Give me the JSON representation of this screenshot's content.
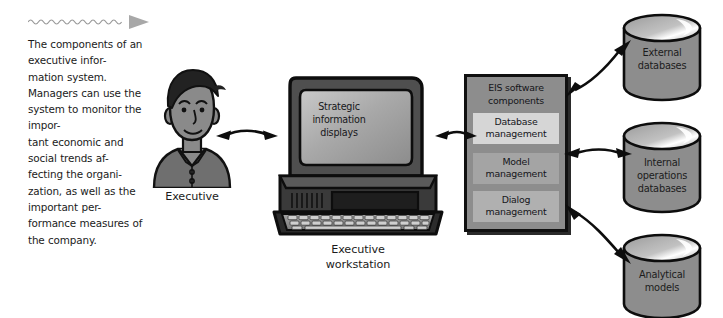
{
  "figure": {
    "caption": "The components of an executive infor-\nmation system. Managers can use the system to monitor the impor-\ntant economic and social trends af-\nfecting the organi-\nzation, as well as the important per-\nformance measures of the company.",
    "rule_icon": "wavy-line-arrow-icon"
  },
  "nodes": {
    "executive": {
      "label": "Executive",
      "icon": "executive-person-icon"
    },
    "workstation": {
      "label": "Executive\nworkstation",
      "screen_text": "Strategic\ninformation\ndisplays",
      "icon": "desktop-computer-icon"
    },
    "eis": {
      "title": "EIS software\ncomponents",
      "items": [
        {
          "label": "Database\nmanagement",
          "fill": "#d6d6d6"
        },
        {
          "label": "Model\nmanagement",
          "fill": "#a4a4a4"
        },
        {
          "label": "Dialog\nmanagement",
          "fill": "#b0b0b0"
        }
      ]
    },
    "databases": [
      {
        "label": "External\ndatabases",
        "icon": "database-cylinder-icon"
      },
      {
        "label": "Internal\noperations\ndatabases",
        "icon": "database-cylinder-icon"
      },
      {
        "label": "Analytical\nmodels",
        "icon": "database-cylinder-icon"
      }
    ]
  },
  "connectors": [
    {
      "name": "executive-to-workstation",
      "icon": "double-headed-arrow-icon",
      "direction": "horizontal"
    },
    {
      "name": "workstation-to-eis",
      "icon": "double-headed-arrow-icon",
      "direction": "horizontal"
    },
    {
      "name": "eis-to-external-databases",
      "icon": "double-headed-arrow-icon",
      "direction": "diagonal-up"
    },
    {
      "name": "eis-to-internal-operations-databases",
      "icon": "double-headed-arrow-icon",
      "direction": "horizontal"
    },
    {
      "name": "eis-to-analytical-models",
      "icon": "double-headed-arrow-icon",
      "direction": "diagonal-down"
    }
  ],
  "colors": {
    "ink": "#101010",
    "box_fill": "#8d8d8d",
    "cylinder_fill": "#8d8d8d",
    "paper": "#ffffff"
  }
}
